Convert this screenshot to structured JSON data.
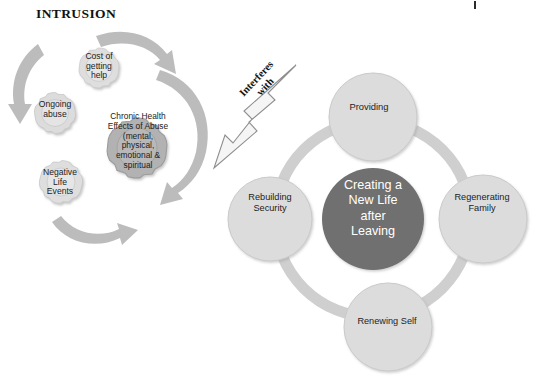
{
  "diagram": {
    "title": "INTRUSION",
    "connector": {
      "label": "Interferes\nwith",
      "kind": "arrow-callout"
    },
    "gears": {
      "section_name": "intrusion-gears",
      "items": [
        {
          "id": "cost-of-getting-help",
          "label": "Cost of\ngetting\nhelp",
          "shade": "light"
        },
        {
          "id": "ongoing-abuse",
          "label": "Ongoing\nabuse",
          "shade": "light"
        },
        {
          "id": "negative-life-events",
          "label": "Negative\nLife\nEvents",
          "shade": "light"
        },
        {
          "id": "chronic-health-effects-of-abuse",
          "label": "Chronic  Health\nEffects of  Abuse\n(mental,\nphysical,\nemotional &\nspiritual",
          "shade": "dark"
        }
      ],
      "rotation_arrows": 4
    },
    "cycle": {
      "section_name": "creating-new-life-cycle",
      "center": {
        "id": "creating-a-new-life-after-leaving",
        "label": "Creating a\nNew Life\nafter\nLeaving"
      },
      "nodes": [
        {
          "id": "providing",
          "label": "Providing",
          "position": "top"
        },
        {
          "id": "regenerating-family",
          "label": "Regenerating\nFamily",
          "position": "right"
        },
        {
          "id": "renewing-self",
          "label": "Renewing Self",
          "position": "bottom"
        },
        {
          "id": "rebuilding-security",
          "label": "Rebuilding\nSecurity",
          "position": "left"
        }
      ]
    },
    "colors": {
      "background": "#ffffff",
      "gear_light": "#dedede",
      "gear_light_edge": "#c4c4c4",
      "gear_dark": "#b2b2b2",
      "gear_dark_edge": "#9b9b9b",
      "arrow_gray": "#b8b8b8",
      "callout_fill": "#f4f4f4",
      "callout_stroke": "#8e8e8e",
      "ring": "#cfcfcf",
      "node_fill": "#dcdcdc",
      "node_edge": "#c9c9c9",
      "center_fill": "#6f6f6f",
      "text_dark": "#1c1c1c",
      "text_light": "#ffffff"
    }
  }
}
